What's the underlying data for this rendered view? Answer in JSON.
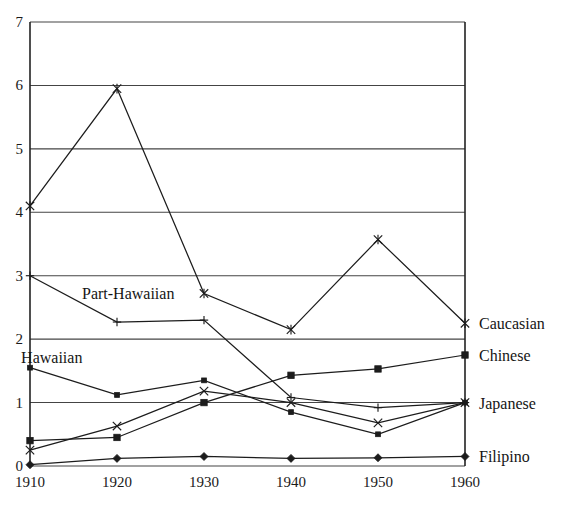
{
  "chart_data": {
    "type": "line",
    "title": "",
    "subtitle": "",
    "xlabel": "",
    "ylabel": "",
    "x": [
      1910,
      1920,
      1930,
      1940,
      1950,
      1960
    ],
    "xtick_labels": [
      "1910",
      "1920",
      "1930",
      "1940",
      "1950",
      "1960"
    ],
    "ytick_labels": [
      "0",
      "1",
      "2",
      "3",
      "4",
      "5",
      "6",
      "7"
    ],
    "xlim": [
      1910,
      1960
    ],
    "ylim": [
      0,
      7
    ],
    "grid": "horizontal",
    "legend_position": "right-of-axis-inline",
    "series": [
      {
        "name": "Caucasian",
        "marker": "asterisk",
        "label_kind": "right-legend",
        "values": [
          4.1,
          5.95,
          2.72,
          2.15,
          3.57,
          2.25
        ]
      },
      {
        "name": "Part-Hawaiian",
        "marker": "plus",
        "label_kind": "inline",
        "values": [
          3.0,
          2.27,
          2.3,
          1.08,
          0.92,
          1.0
        ]
      },
      {
        "name": "Hawaiian",
        "marker": "small-square",
        "label_kind": "inline",
        "values": [
          1.55,
          1.12,
          1.35,
          0.85,
          0.5,
          1.0
        ]
      },
      {
        "name": "Chinese",
        "marker": "square",
        "label_kind": "right-legend",
        "values": [
          0.4,
          0.45,
          1.0,
          1.43,
          1.53,
          1.75
        ]
      },
      {
        "name": "Japanese",
        "marker": "cross",
        "label_kind": "right-legend",
        "values": [
          0.25,
          0.63,
          1.18,
          1.0,
          0.68,
          1.0
        ]
      },
      {
        "name": "Filipino",
        "marker": "diamond",
        "label_kind": "right-legend",
        "values": [
          0.02,
          0.12,
          0.15,
          0.12,
          0.13,
          0.15
        ]
      }
    ],
    "right_labels": [
      {
        "text": "Caucasian",
        "value": 2.25
      },
      {
        "text": "Chinese",
        "value": 1.75
      },
      {
        "text": "Japanese",
        "value": 1.0
      },
      {
        "text": "Filipino",
        "value": 0.15
      }
    ],
    "inline_labels": [
      {
        "text": "Part-Hawaiian",
        "x": 1920,
        "value": 2.72
      },
      {
        "text": "Hawaiian",
        "x": 1913,
        "value": 1.72
      }
    ],
    "colors": {
      "ink": "#1c1c1c",
      "grid": "#444444",
      "axis": "#222222",
      "background": "#ffffff"
    }
  }
}
